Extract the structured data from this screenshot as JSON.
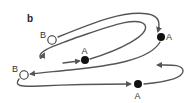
{
  "figure": {
    "panel_label": "b",
    "colors": {
      "line": "#555555",
      "filled_node": "#111111",
      "open_node": "#ffffff",
      "text": "#333333"
    },
    "nodes": [
      {
        "id": "B-top",
        "label": "B",
        "type": "open"
      },
      {
        "id": "A-inner",
        "label": "A",
        "type": "filled"
      },
      {
        "id": "A-right",
        "label": "A",
        "type": "filled"
      },
      {
        "id": "B-bottom",
        "label": "B",
        "type": "open"
      },
      {
        "id": "A-bottom",
        "label": "A",
        "type": "filled"
      }
    ]
  }
}
